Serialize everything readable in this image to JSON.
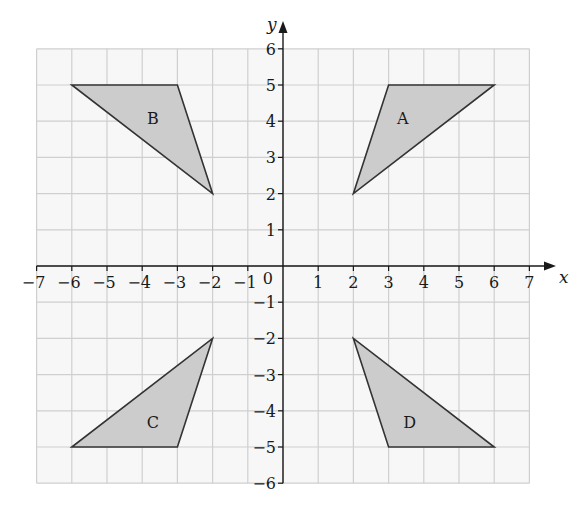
{
  "grid": {
    "x_min": -7,
    "x_max": 7,
    "y_min": -6,
    "y_max": 6,
    "origin_px": [
      283,
      266
    ],
    "cell_px": [
      35.2,
      36.2
    ],
    "background": "#f7f7f7",
    "line_color": "#cfcfcf"
  },
  "axes": {
    "x_label": "x",
    "y_label": "y",
    "origin_label": "0",
    "x_ticks": [
      "-7",
      "-6",
      "-5",
      "-4",
      "-3",
      "-2",
      "-1",
      "1",
      "2",
      "3",
      "4",
      "5",
      "6",
      "7"
    ],
    "y_ticks": [
      "6",
      "5",
      "4",
      "3",
      "2",
      "1",
      "-1",
      "-2",
      "-3",
      "-4",
      "-5",
      "-6"
    ]
  },
  "shapes": [
    {
      "label": "A",
      "vertices": [
        [
          2,
          2
        ],
        [
          3,
          5
        ],
        [
          6,
          5
        ]
      ],
      "label_pos": [
        3.4,
        4.1
      ]
    },
    {
      "label": "B",
      "vertices": [
        [
          -2,
          2
        ],
        [
          -3,
          5
        ],
        [
          -6,
          5
        ]
      ],
      "label_pos": [
        -3.7,
        4.1
      ]
    },
    {
      "label": "C",
      "vertices": [
        [
          -2,
          -2
        ],
        [
          -3,
          -5
        ],
        [
          -6,
          -5
        ]
      ],
      "label_pos": [
        -3.7,
        -4.3
      ]
    },
    {
      "label": "D",
      "vertices": [
        [
          2,
          -2
        ],
        [
          3,
          -5
        ],
        [
          6,
          -5
        ]
      ],
      "label_pos": [
        3.6,
        -4.3
      ]
    }
  ],
  "style": {
    "fill": "#cccccc",
    "stroke": "#333333"
  },
  "chart_data": {
    "type": "scatter",
    "title": "",
    "xlabel": "x",
    "ylabel": "y",
    "xlim": [
      -7,
      7
    ],
    "ylim": [
      -6,
      6
    ],
    "grid": true,
    "series": [
      {
        "name": "A",
        "points": [
          [
            2,
            2
          ],
          [
            3,
            5
          ],
          [
            6,
            5
          ]
        ]
      },
      {
        "name": "B",
        "points": [
          [
            -2,
            2
          ],
          [
            -3,
            5
          ],
          [
            -6,
            5
          ]
        ]
      },
      {
        "name": "C",
        "points": [
          [
            -2,
            -2
          ],
          [
            -3,
            -5
          ],
          [
            -6,
            -5
          ]
        ]
      },
      {
        "name": "D",
        "points": [
          [
            2,
            -2
          ],
          [
            3,
            -5
          ],
          [
            6,
            -5
          ]
        ]
      }
    ]
  }
}
